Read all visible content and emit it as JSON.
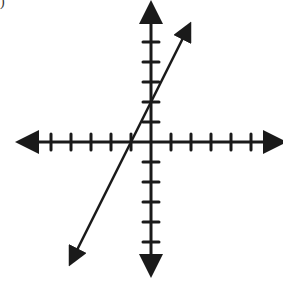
{
  "corner_label": ")",
  "chart_data": {
    "type": "line",
    "title": "",
    "xlabel": "",
    "ylabel": "",
    "grid": false,
    "legend": "none",
    "axes": {
      "origin_px": [
        151,
        142
      ],
      "unit_px": 20,
      "x_ticks": [
        -5,
        -4,
        -3,
        -2,
        -1,
        1,
        2,
        3,
        4,
        5
      ],
      "y_ticks": [
        -5,
        -4,
        -3,
        -2,
        -1,
        1,
        2,
        3,
        4,
        5
      ],
      "xlim": [
        -6.5,
        6.5
      ],
      "ylim": [
        -6.5,
        6.8
      ],
      "tick_labels_shown": false,
      "arrows_on_axes": true
    },
    "series": [
      {
        "name": "line",
        "equation": "y = 2x + 2",
        "slope": 2,
        "y_intercept": 2,
        "x_intercept": -1,
        "x": [
          -4,
          1.9
        ],
        "y": [
          -6,
          5.8
        ],
        "arrows_both_ends": true,
        "color": "#1a1a1a"
      }
    ]
  }
}
